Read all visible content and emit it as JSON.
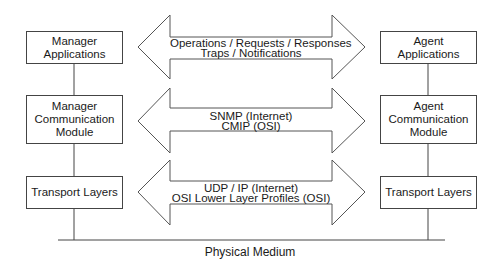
{
  "manager": {
    "applications": "Manager\nApplications",
    "communication_module": "Manager\nCommunication\nModule",
    "transport": "Transport Layers"
  },
  "agent": {
    "applications": "Agent\nApplications",
    "communication_module": "Agent\nCommunication\nModule",
    "transport": "Transport Layers"
  },
  "arrows": [
    {
      "line1": "Operations / Requests / Responses",
      "line2": "Traps / Notifications"
    },
    {
      "line1": "SNMP (Internet)",
      "line2": "CMIP (OSI)"
    },
    {
      "line1": "UDP / IP (Internet)",
      "line2": "OSI Lower Layer Profiles (OSI)"
    }
  ],
  "medium": {
    "label": "Physical Medium"
  },
  "colors": {
    "stroke": "#444444",
    "text": "#1a1a1a"
  }
}
